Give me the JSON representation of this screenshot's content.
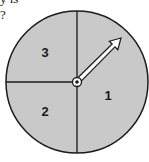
{
  "question": {
    "cut_line": "y is",
    "question_mark": "?"
  },
  "spinner": {
    "center": [
      77,
      82
    ],
    "radius": 71,
    "fill_color": "#c9c9c9",
    "stroke_color": "#1a1a1a",
    "arrow_tip": [
      120,
      39
    ],
    "sections": [
      {
        "label": "3",
        "position": "top-left",
        "x": 45,
        "y": 57
      },
      {
        "label": "2",
        "position": "bottom-left",
        "x": 45,
        "y": 116
      },
      {
        "label": "1",
        "position": "right",
        "x": 108,
        "y": 100
      }
    ],
    "pointer": "arrow pointing up-right toward top-right region"
  }
}
